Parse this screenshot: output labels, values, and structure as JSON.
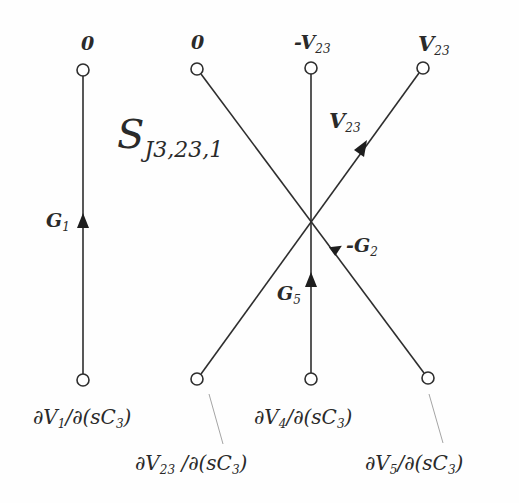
{
  "diagram": {
    "title": {
      "main": "S",
      "subscript": "J3,23,1"
    },
    "left_graph": {
      "top_node_label": "0",
      "bottom_node_label": {
        "main": "∂V",
        "sub": "1",
        "rest": "/∂(sC",
        "sub2": "3",
        "close": ")"
      },
      "edge_gain": {
        "main": "G",
        "sub": "1"
      }
    },
    "right_graph": {
      "top_node_labels": [
        {
          "main": "0",
          "sub": ""
        },
        {
          "main": "-V",
          "sub": "23"
        },
        {
          "main": "V",
          "sub": "23"
        }
      ],
      "bottom_node_labels": [
        {
          "main": "∂V",
          "sub": "23",
          "rest": " /∂(sC",
          "sub2": "3",
          "close": ")"
        },
        {
          "main": "∂V",
          "sub": "4",
          "rest": "/∂(sC",
          "sub2": "3",
          "close": ")"
        },
        {
          "main": "∂V",
          "sub": "5",
          "rest": "/∂(sC",
          "sub2": "3",
          "close": ")"
        }
      ],
      "edge_gains": [
        {
          "main": "V",
          "sub": "23"
        },
        {
          "main": "-G",
          "sub": "2"
        },
        {
          "main": "G",
          "sub": "5"
        }
      ]
    },
    "colors": {
      "line": "#2e2e2e",
      "text": "#2a2a2a",
      "leader": "#9a9a9a",
      "background": "#fefefe"
    }
  }
}
